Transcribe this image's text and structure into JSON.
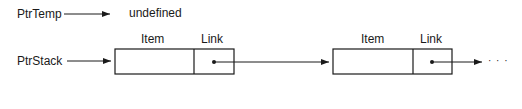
{
  "diagram": {
    "pointers": [
      {
        "name": "PtrTemp",
        "target_text": "undefined"
      },
      {
        "name": "PtrStack"
      }
    ],
    "nodes": [
      {
        "field_labels": [
          "Item",
          "Link"
        ]
      },
      {
        "field_labels": [
          "Item",
          "Link"
        ]
      }
    ],
    "continuation": "· · ·"
  },
  "colors": {
    "ink": "#1a1a1a",
    "background": "#ffffff"
  }
}
